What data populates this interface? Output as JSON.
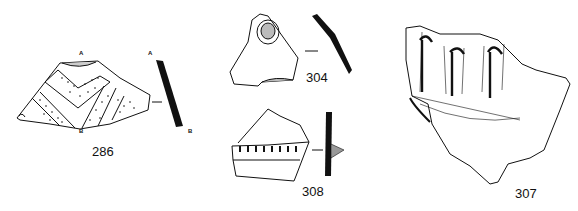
{
  "figure": {
    "sherds": [
      {
        "id": "286",
        "label": "286",
        "section_top": "A",
        "section_bottom": "B",
        "decoration": "dotted chevron bands",
        "profile_top": "A",
        "profile_bottom": "B"
      },
      {
        "id": "304",
        "label": "304",
        "decoration": "circular boss"
      },
      {
        "id": "308",
        "label": "308",
        "decoration": "notched applied band"
      },
      {
        "id": "307",
        "label": "307",
        "decoration": "vertical ribs with hooked tops"
      }
    ],
    "ink_color": "#111111",
    "background": "#ffffff"
  }
}
